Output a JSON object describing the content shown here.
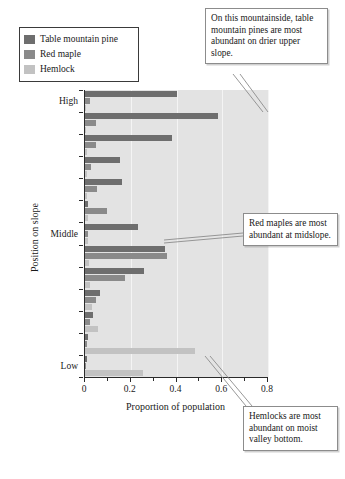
{
  "legend": {
    "items": [
      {
        "label": "Table mountain pine",
        "color": "#6e6e6e",
        "icon": "legend-swatch"
      },
      {
        "label": "Red maple",
        "color": "#8a8a8a",
        "icon": "legend-swatch"
      },
      {
        "label": "Hemlock",
        "color": "#c2c2c2",
        "icon": "legend-swatch"
      }
    ]
  },
  "annotations": [
    {
      "id": "pine-note",
      "text": "On this mountainside, table mountain pines are most abundant on drier upper slope."
    },
    {
      "id": "maple-note",
      "text": "Red maples are most abundant at midslope."
    },
    {
      "id": "hemlock-note",
      "text": "Hemlocks are most abundant on moist valley bottom."
    }
  ],
  "chart_data": {
    "type": "bar",
    "orientation": "horizontal",
    "title": "",
    "xlabel": "Proportion of population",
    "ylabel": "Position on slope",
    "xlim": [
      0,
      0.8
    ],
    "xticks": [
      0,
      0.2,
      0.4,
      0.6,
      0.8
    ],
    "xticklabels": [
      "0",
      "0.2",
      "0.4",
      "0.6",
      "0.8"
    ],
    "grid": true,
    "legend_position": "top-left",
    "categories": [
      "High",
      "",
      "",
      "",
      "",
      "",
      "Middle",
      "",
      "",
      "",
      "",
      "",
      "Low"
    ],
    "position_labels": [
      "High",
      "Middle",
      "Low"
    ],
    "series": [
      {
        "name": "Table mountain pine",
        "color": "#6e6e6e",
        "values": [
          0.4,
          0.58,
          0.38,
          0.155,
          0.16,
          0.015,
          0.23,
          0.35,
          0.26,
          0.065,
          0.035,
          0.012,
          0.008
        ]
      },
      {
        "name": "Red maple",
        "color": "#8a8a8a",
        "values": [
          0.022,
          0.047,
          0.048,
          0.028,
          0.052,
          0.095,
          0.012,
          0.36,
          0.175,
          0.048,
          0.02,
          0.008,
          0.005
        ]
      },
      {
        "name": "Hemlock",
        "color": "#c2c2c2",
        "values": [
          0.004,
          0.006,
          0.007,
          0.008,
          0.01,
          0.012,
          0.014,
          0.018,
          0.02,
          0.032,
          0.055,
          0.48,
          0.255
        ]
      }
    ]
  }
}
